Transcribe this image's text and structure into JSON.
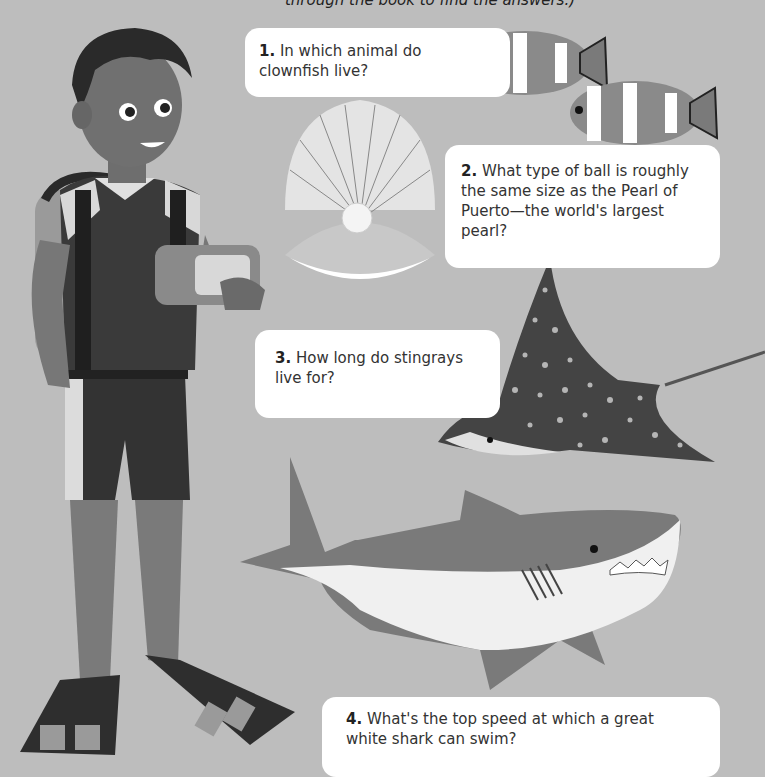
{
  "intro_text": "through the book to find the answers.)",
  "questions": [
    {
      "number": "1.",
      "text": "In which animal do clownfish live?"
    },
    {
      "number": "2.",
      "text": "What type of ball is roughly the same size as the Pearl of Puerto—the world's largest pearl?"
    },
    {
      "number": "3.",
      "text": "How long do stingrays live for?"
    },
    {
      "number": "4.",
      "text": "What's the top speed at which a great white shark can swim?"
    }
  ],
  "illustrations": [
    "diver-boy",
    "clownfish-pair",
    "pearl-in-shell",
    "spotted-eagle-ray",
    "great-white-shark"
  ],
  "colors": {
    "background": "#bdbdbd",
    "box": "#ffffff",
    "text": "#333333"
  }
}
